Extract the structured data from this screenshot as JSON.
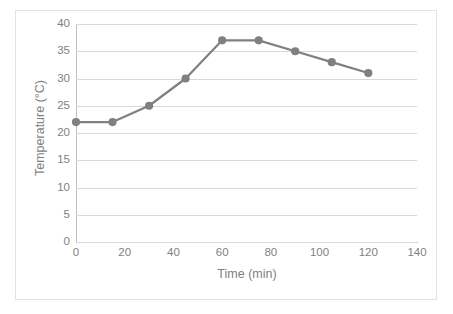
{
  "chart_data": {
    "type": "line",
    "title": "",
    "xlabel": "Time (min)",
    "ylabel": "Temperature (°C)",
    "xlim": [
      0,
      140
    ],
    "ylim": [
      0,
      40
    ],
    "xticks": [
      0,
      20,
      40,
      60,
      80,
      100,
      120,
      140
    ],
    "yticks": [
      0,
      5,
      10,
      15,
      20,
      25,
      30,
      35,
      40
    ],
    "xtick_labels": [
      "0",
      "20",
      "40",
      "60",
      "80",
      "100",
      "120",
      "140"
    ],
    "ytick_labels": [
      "0",
      "5",
      "10",
      "15",
      "20",
      "25",
      "30",
      "35",
      "40"
    ],
    "grid": "horizontal",
    "legend": "none",
    "series": [
      {
        "name": "Temperature",
        "color": "#808080",
        "marker": "circle",
        "x": [
          0,
          15,
          30,
          45,
          60,
          75,
          90,
          105,
          120
        ],
        "values": [
          22,
          22,
          25,
          30,
          37,
          37,
          35,
          33,
          31
        ]
      }
    ]
  },
  "style": {
    "border_color": "#e2e2e2",
    "grid_color": "#d9d9d9",
    "axis_color": "#bfbfbf",
    "text_color": "#7f7f7f",
    "series_color": "#808080",
    "background": "#ffffff"
  }
}
